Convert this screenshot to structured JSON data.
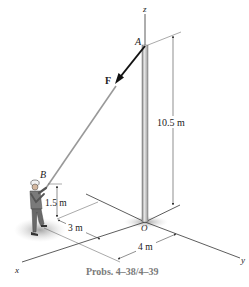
{
  "figure": {
    "caption": "Probs. 4–38/4–39",
    "labels": {
      "z_axis": "z",
      "x_axis": "x",
      "y_axis": "y",
      "point_A": "A",
      "point_B": "B",
      "origin": "O",
      "force": "F"
    },
    "dimensions": {
      "pole_height": "10.5 m",
      "hand_height": "1.5 m",
      "x_offset": "3 m",
      "y_offset": "4 m"
    },
    "colors": {
      "line": "#333333",
      "pole": "#b8b8b8",
      "shadow": "#c8c8c8",
      "caption": "#7a7a7a"
    }
  }
}
